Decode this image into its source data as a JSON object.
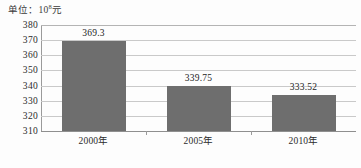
{
  "figure": {
    "unit_caption_prefix": "单位：10",
    "unit_caption_exponent": "8",
    "unit_caption_suffix": "元",
    "bar_color": "#6e6e6e",
    "gridline_color": "#c9c9c9",
    "axis_color": "#9a9a9a",
    "background_color": "#fdfdfd"
  },
  "chart_data": {
    "type": "bar",
    "title": "",
    "subtitle": "",
    "xlabel": "",
    "ylabel": "单位：10⁸元",
    "categories": [
      "2000年",
      "2005年",
      "2010年"
    ],
    "values": [
      369.3,
      339.75,
      333.52
    ],
    "data_labels": [
      "369.3",
      "339.75",
      "333.52"
    ],
    "ylim": [
      310,
      380
    ],
    "ytick_step": 10,
    "ytick_labels": [
      "380",
      "370",
      "360",
      "350",
      "340",
      "330",
      "320",
      "310"
    ],
    "ytick_values": [
      380,
      370,
      360,
      350,
      340,
      330,
      320,
      310
    ],
    "grid": true,
    "grid_axis": "y",
    "legend": false,
    "legend_position": "none",
    "series": [
      {
        "name": "",
        "values": [
          369.3,
          339.75,
          333.52
        ],
        "color": "#6e6e6e"
      }
    ]
  }
}
